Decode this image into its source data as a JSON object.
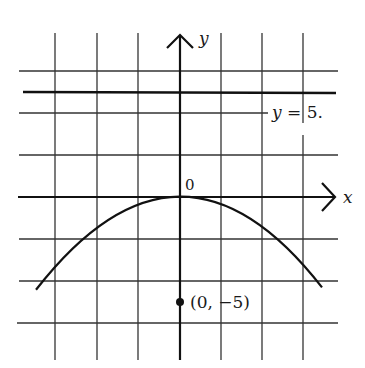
{
  "figure": {
    "axes": {
      "x_label": "x",
      "y_label": "y",
      "origin_label": "0"
    },
    "directrix": {
      "label": "y = 5.",
      "y_value": 5
    },
    "focus": {
      "label": "(0, −5)",
      "x": 0,
      "y": -5
    },
    "curve": {
      "equation": "y = -x^2/10",
      "x_min": -6.86,
      "x_max": 6.7
    },
    "grid": {
      "units_per_cell": 2,
      "vertical_lines_x": [
        -6,
        -4,
        -2,
        2,
        4,
        6
      ],
      "horizontal_lines_y": [
        6,
        4,
        2,
        -2,
        -4,
        -6
      ]
    },
    "colors": {
      "ink": "#1a1a1a",
      "grid": "#333333",
      "background": "#ffffff"
    }
  }
}
